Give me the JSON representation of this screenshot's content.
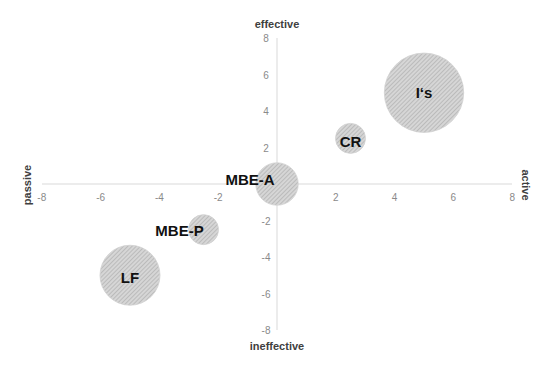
{
  "chart_data": {
    "type": "bubble",
    "title": "",
    "xlabel_left": "passive",
    "xlabel_right": "active",
    "ylabel_top": "effective",
    "ylabel_bottom": "ineffective",
    "xlim": [
      -8,
      8
    ],
    "ylim": [
      -8,
      8
    ],
    "x_ticks": [
      -8,
      -6,
      -4,
      -2,
      0,
      2,
      4,
      6,
      8
    ],
    "y_ticks": [
      -8,
      -6,
      -4,
      -2,
      2,
      4,
      6,
      8
    ],
    "grid": false,
    "legend": "none",
    "series": [
      {
        "name": "I‘s",
        "x": 5,
        "y": 5,
        "size": 7
      },
      {
        "name": "CR",
        "x": 2.5,
        "y": 2.5,
        "size": 1
      },
      {
        "name": "MBE-A",
        "x": 0,
        "y": 0,
        "size": 2
      },
      {
        "name": "MBE-P",
        "x": -2.5,
        "y": -2.5,
        "size": 1
      },
      {
        "name": "LF",
        "x": -5,
        "y": -5,
        "size": 4
      }
    ],
    "colors": {
      "bubble_fill": "#d4d4d4",
      "hatch": "#a8a8a8",
      "axis": "#d9d9d9",
      "tick_text": "#8a8a8a",
      "label_text": "#111111"
    }
  }
}
